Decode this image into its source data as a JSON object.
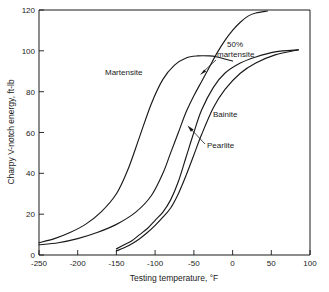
{
  "chart_data": {
    "type": "line",
    "title": "",
    "xlabel": "Testing temperature, °F",
    "ylabel": "Charpy V-notch energy, ft-lb",
    "xlim": [
      -250,
      100
    ],
    "ylim": [
      0,
      120
    ],
    "xticks": [
      -250,
      -200,
      -150,
      -100,
      -50,
      0,
      50,
      100
    ],
    "xtick_labels": [
      "-250",
      "-200",
      "-150",
      "-100",
      "-50",
      "0",
      "50",
      "100"
    ],
    "yticks": [
      0,
      20,
      40,
      60,
      80,
      100,
      120
    ],
    "ytick_labels": [
      "0",
      "20",
      "40",
      "60",
      "80",
      "100",
      "120"
    ],
    "grid": false,
    "legend_position": "inline-annotations",
    "series": [
      {
        "name": "Martensite",
        "label": "Martensite",
        "x": [
          -250,
          -230,
          -210,
          -190,
          -170,
          -150,
          -135,
          -120,
          -105,
          -90,
          -75,
          -60,
          -45,
          -30,
          -20,
          -10,
          0
        ],
        "y": [
          6,
          8,
          11,
          15,
          21,
          30,
          42,
          58,
          74,
          86,
          93,
          96.5,
          97.5,
          97.5,
          97,
          96,
          95
        ]
      },
      {
        "name": "Bainite",
        "label": "Bainite",
        "x": [
          -250,
          -225,
          -200,
          -175,
          -150,
          -125,
          -105,
          -90,
          -80,
          -70,
          -60,
          -50,
          -40,
          -30,
          -20,
          -10,
          0,
          10,
          20,
          30,
          45
        ],
        "y": [
          5,
          6,
          8,
          11,
          15,
          21,
          29,
          40,
          50,
          60,
          70,
          78,
          85,
          92,
          99,
          105,
          110,
          114,
          117,
          118.5,
          119.5
        ]
      },
      {
        "name": "Pearlite-upper",
        "label": "Pearlite",
        "x": [
          -150,
          -140,
          -130,
          -120,
          -110,
          -100,
          -90,
          -80,
          -70,
          -60,
          -50,
          -40,
          -25,
          -10,
          10,
          30,
          55,
          85
        ],
        "y": [
          3,
          5,
          7,
          10,
          13,
          17,
          21,
          27,
          36,
          48,
          60,
          71,
          82,
          89,
          94,
          97,
          99.5,
          100.5
        ]
      },
      {
        "name": "Pearlite-lower",
        "label": "Pearlite",
        "x": [
          -150,
          -140,
          -130,
          -120,
          -110,
          -100,
          -90,
          -80,
          -70,
          -60,
          -50,
          -40,
          -25,
          -10,
          10,
          30,
          55,
          85
        ],
        "y": [
          2,
          3.5,
          5.5,
          8,
          11,
          14.5,
          18.5,
          23,
          30,
          39,
          49,
          59,
          72,
          81,
          89,
          94,
          98,
          100.5
        ]
      }
    ],
    "annotations": [
      {
        "text": "50% martensite",
        "line1": "50%",
        "line2": "martensite",
        "target_x": -40,
        "target_y": 85
      },
      {
        "text": "Martensite",
        "target_x": -145,
        "target_y": 87
      },
      {
        "text": "Bainite",
        "target_x": -25,
        "target_y": 73
      },
      {
        "text": "Pearlite",
        "target_x": -48,
        "target_y": 62
      }
    ]
  }
}
